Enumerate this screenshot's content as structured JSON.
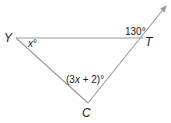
{
  "diagram": {
    "type": "triangle-exterior-angle",
    "vertices": [
      {
        "id": "Y",
        "label": "Y"
      },
      {
        "id": "T",
        "label": "T"
      },
      {
        "id": "C",
        "label": "C"
      }
    ],
    "angles": {
      "Y": {
        "prefix": "",
        "var": "x",
        "suffix": "°"
      },
      "C": {
        "prefix": "(3",
        "var": "x",
        "suffix": " + 2)°"
      },
      "exterior_T": {
        "text": "130°"
      }
    },
    "ray": {
      "from": "C",
      "through": "T",
      "arrow": true
    },
    "colors": {
      "line": "#9a9a9a",
      "text": "#1a1a1a"
    }
  }
}
